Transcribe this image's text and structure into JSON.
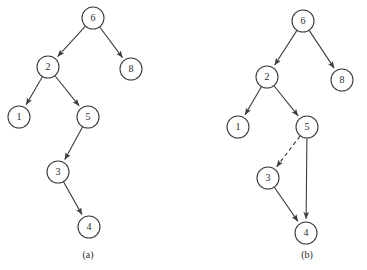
{
  "figure": {
    "width": 367,
    "height": 270,
    "background": "#ffffff",
    "stroke_color": "#3c3c3c",
    "text_color": "#2b2b2b",
    "node_radius": 11,
    "panels": [
      {
        "id": "panel-a",
        "caption": "(a)",
        "caption_x": 88,
        "caption_y": 256,
        "nodes": [
          {
            "id": "a6",
            "label": "6",
            "x": 93,
            "y": 18
          },
          {
            "id": "a2",
            "label": "2",
            "x": 48,
            "y": 67
          },
          {
            "id": "a8",
            "label": "8",
            "x": 131,
            "y": 69
          },
          {
            "id": "a1",
            "label": "1",
            "x": 19,
            "y": 117
          },
          {
            "id": "a5",
            "label": "5",
            "x": 88,
            "y": 117
          },
          {
            "id": "a3",
            "label": "3",
            "x": 58,
            "y": 172
          },
          {
            "id": "a4",
            "label": "4",
            "x": 89,
            "y": 227
          }
        ],
        "edges": [
          {
            "id": "a-6-2",
            "from": "a6",
            "to": "a2",
            "style": "solid",
            "arrow": true
          },
          {
            "id": "a-6-8",
            "from": "a6",
            "to": "a8",
            "style": "solid",
            "arrow": true
          },
          {
            "id": "a-2-1",
            "from": "a2",
            "to": "a1",
            "style": "solid",
            "arrow": true
          },
          {
            "id": "a-2-5",
            "from": "a2",
            "to": "a5",
            "style": "solid",
            "arrow": true
          },
          {
            "id": "a-5-3",
            "from": "a5",
            "to": "a3",
            "style": "solid",
            "arrow": true
          },
          {
            "id": "a-3-4",
            "from": "a3",
            "to": "a4",
            "style": "solid",
            "arrow": true
          }
        ]
      },
      {
        "id": "panel-b",
        "caption": "(b)",
        "caption_x": 307,
        "caption_y": 256,
        "nodes": [
          {
            "id": "b6",
            "label": "6",
            "x": 303,
            "y": 21
          },
          {
            "id": "b2",
            "label": "2",
            "x": 267,
            "y": 77
          },
          {
            "id": "b8",
            "label": "8",
            "x": 342,
            "y": 80
          },
          {
            "id": "b1",
            "label": "1",
            "x": 238,
            "y": 127
          },
          {
            "id": "b5",
            "label": "5",
            "x": 307,
            "y": 127
          },
          {
            "id": "b3",
            "label": "3",
            "x": 268,
            "y": 178
          },
          {
            "id": "b4",
            "label": "4",
            "x": 306,
            "y": 233
          }
        ],
        "edges": [
          {
            "id": "b-6-2",
            "from": "b6",
            "to": "b2",
            "style": "solid",
            "arrow": true
          },
          {
            "id": "b-6-8",
            "from": "b6",
            "to": "b8",
            "style": "solid",
            "arrow": true
          },
          {
            "id": "b-2-1",
            "from": "b2",
            "to": "b1",
            "style": "solid",
            "arrow": true
          },
          {
            "id": "b-2-5",
            "from": "b2",
            "to": "b5",
            "style": "solid",
            "arrow": true
          },
          {
            "id": "b-5-3",
            "from": "b5",
            "to": "b3",
            "style": "dashed",
            "arrow": true
          },
          {
            "id": "b-5-4",
            "from": "b5",
            "to": "b4",
            "style": "solid",
            "arrow": true
          },
          {
            "id": "b-3-4",
            "from": "b3",
            "to": "b4",
            "style": "solid",
            "arrow": true
          }
        ]
      }
    ]
  }
}
